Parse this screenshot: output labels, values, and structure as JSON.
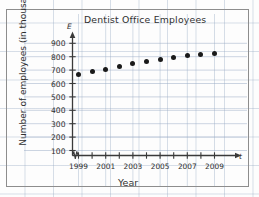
{
  "chart_data": {
    "type": "scatter",
    "title": "Dentist Office Employees",
    "xlabel": "Year",
    "ylabel": "Number of employees (in thousands)",
    "x_axis_variable": "t",
    "y_axis_variable": "E",
    "grid": true,
    "legend": null,
    "x_axis_break": true,
    "xlim": [
      1998.4,
      2010.2
    ],
    "ylim": [
      0,
      950
    ],
    "y_ticks": [
      100,
      200,
      300,
      400,
      500,
      600,
      700,
      800,
      900
    ],
    "y_tick_labels": [
      "100",
      "200",
      "300",
      "400",
      "500",
      "600",
      "700",
      "800",
      "900"
    ],
    "x_ticks": [
      1999,
      2000,
      2001,
      2002,
      2003,
      2004,
      2005,
      2006,
      2007,
      2008,
      2009
    ],
    "x_tick_labels": [
      "1999",
      "",
      "2001",
      "",
      "2003",
      "",
      "2005",
      "",
      "2007",
      "",
      "2009"
    ],
    "x_labeled_ticks": [
      "1999",
      "2001",
      "2003",
      "2005",
      "2007",
      "2009"
    ],
    "x": [
      1999,
      2000,
      2001,
      2002,
      2003,
      2004,
      2005,
      2006,
      2007,
      2008,
      2009
    ],
    "values": [
      670,
      690,
      705,
      725,
      748,
      765,
      778,
      792,
      808,
      820,
      822
    ],
    "point_color": "#1a1a1a",
    "grid_color": "#96aac3",
    "axis_color": "#3a3a3a"
  },
  "page": {
    "background": "#fdfdfd",
    "frame_color": "#8d8d8d"
  }
}
